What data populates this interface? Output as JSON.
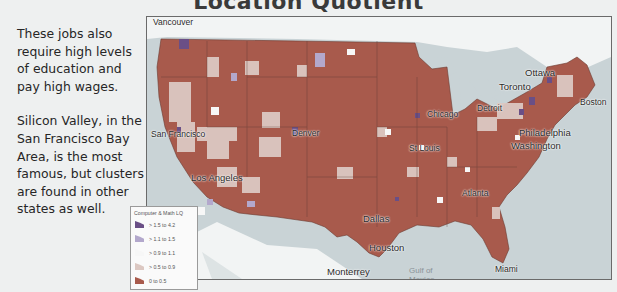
{
  "slide": {
    "title": "Location Quotient",
    "paragraphs": [
      "These jobs also require high levels of education and pay high wages.",
      "Silicon Valley, in the San Francisco Bay Area, is the most famous, but clusters are found in other states as well."
    ]
  },
  "map": {
    "cities": [
      {
        "name": "Vancouver"
      },
      {
        "name": "San Francisco"
      },
      {
        "name": "Los Angeles"
      },
      {
        "name": "Denver"
      },
      {
        "name": "Dallas"
      },
      {
        "name": "Houston"
      },
      {
        "name": "Monterrey"
      },
      {
        "name": "Chicago"
      },
      {
        "name": "St Louis"
      },
      {
        "name": "Detroit"
      },
      {
        "name": "Toronto"
      },
      {
        "name": "Ottawa"
      },
      {
        "name": "Boston"
      },
      {
        "name": "Philadelphia"
      },
      {
        "name": "Washington"
      },
      {
        "name": "Atlanta"
      },
      {
        "name": "Miami"
      },
      {
        "name": "Gulf of Mexico"
      }
    ],
    "colors": {
      "water": "#c9d3d6",
      "foreign_land": "#f2f4f4",
      "state_border": "#5a3a30"
    }
  },
  "legend": {
    "title": "Computer & Math LQ",
    "items": [
      {
        "label": "> 1.5 to 4.2",
        "color": "#6a4f86"
      },
      {
        "label": "> 1.1 to 1.5",
        "color": "#b3a8cc"
      },
      {
        "label": "> 0.9 to 1.1",
        "color": "#f7f7f7"
      },
      {
        "label": "> 0.5 to 0.9",
        "color": "#dcc8c2"
      },
      {
        "label": "0 to 0.5",
        "color": "#a85a4c"
      }
    ]
  }
}
